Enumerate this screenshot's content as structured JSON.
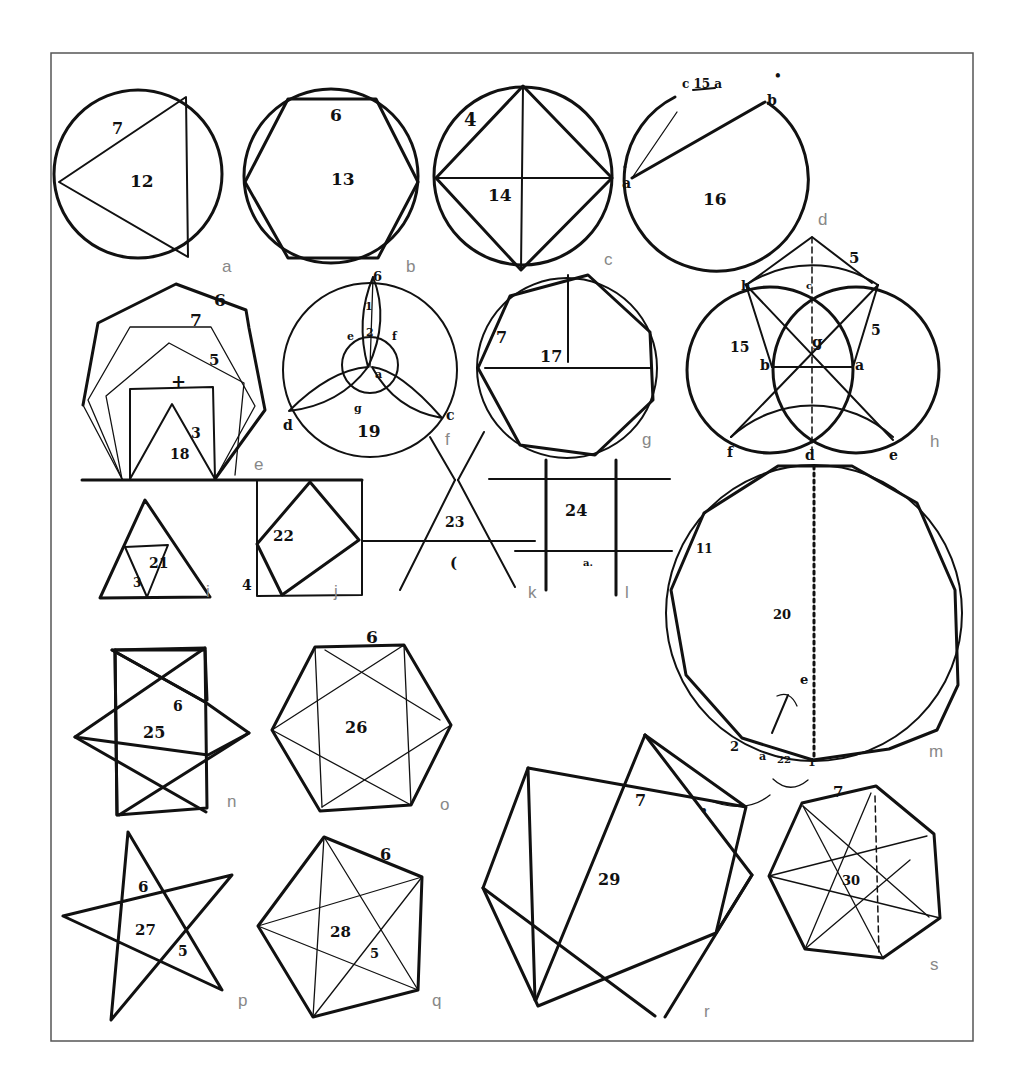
{
  "frame": {
    "x": 51,
    "y": 53,
    "width": 922,
    "height": 988,
    "border_color": "#555555"
  },
  "figures": [
    {
      "id": "a",
      "caption": "a",
      "description": "equilateral triangle inscribed in circle",
      "labels": {
        "number": "12",
        "side": "7"
      }
    },
    {
      "id": "b",
      "caption": "b",
      "description": "hexagon inscribed in circle",
      "labels": {
        "number": "13",
        "side": "6"
      }
    },
    {
      "id": "c",
      "caption": "c",
      "description": "square inscribed in circle with diameters",
      "labels": {
        "number": "14",
        "side": "4"
      }
    },
    {
      "id": "d",
      "caption": "d",
      "description": "circle with chords from point a",
      "labels": {
        "number": "16",
        "point_a": "a",
        "point_b": "b",
        "arc_label": "c 15 a",
        "dot": "•"
      }
    },
    {
      "id": "e",
      "caption": "e",
      "description": "nested polygons on a common base",
      "labels": {
        "number": "18",
        "heptagon": "7",
        "hexagon": "6",
        "pentagon": "5",
        "square": "+",
        "triangle": "3"
      }
    },
    {
      "id": "f",
      "caption": "f",
      "description": "trefoil construction in circle",
      "labels": {
        "number": "19",
        "side_1": "1",
        "side_2": "2",
        "point_b": "b",
        "point_e": "e",
        "point_f": "f",
        "point_a": "a",
        "point_g": "g",
        "point_d": "d",
        "point_c": "c"
      }
    },
    {
      "id": "g",
      "caption": "g",
      "description": "heptagon inscribed in circle",
      "labels": {
        "number": "17",
        "side": "7"
      }
    },
    {
      "id": "h",
      "caption": "h",
      "description": "pentagon construction with intersecting circles",
      "labels": {
        "number": "15",
        "side": "5",
        "point_h": "h",
        "point_c": "c",
        "point_g": "g",
        "point_b": "b",
        "point_a": "a",
        "point_5": "5",
        "point_f": "f",
        "point_d": "d",
        "point_e": "e"
      }
    },
    {
      "id": "i",
      "caption": "i",
      "description": "subdivided equilateral triangle",
      "labels": {
        "number": "21",
        "small": "3"
      }
    },
    {
      "id": "j",
      "caption": "j",
      "description": "square inscribed in square",
      "labels": {
        "number": "22",
        "corner": "4"
      }
    },
    {
      "id": "k",
      "caption": "k",
      "description": "crossing lines forming triangle",
      "labels": {
        "number": "23",
        "mark": "("
      }
    },
    {
      "id": "l",
      "caption": "l",
      "description": "grid of crossing lines",
      "labels": {
        "number": "24",
        "mark": "a."
      }
    },
    {
      "id": "m",
      "caption": "m",
      "description": "11-gon inscribed in circle with dotted diameter",
      "labels": {
        "number": "20",
        "side": "11",
        "point_e": "e",
        "point_2": "2",
        "point_a": "a",
        "arc": "22",
        "point_1": "1"
      }
    },
    {
      "id": "n",
      "caption": "n",
      "description": "six-pointed star",
      "labels": {
        "number": "25",
        "side": "6"
      }
    },
    {
      "id": "o",
      "caption": "o",
      "description": "hexagon with inscribed star",
      "labels": {
        "number": "26",
        "side": "6"
      }
    },
    {
      "id": "p",
      "caption": "p",
      "description": "five-pointed star",
      "labels": {
        "number": "27",
        "top": "6",
        "side": "5"
      }
    },
    {
      "id": "q",
      "caption": "q",
      "description": "pentagon with inscribed star",
      "labels": {
        "number": "28",
        "side": "6",
        "inner": "5"
      }
    },
    {
      "id": "r",
      "caption": "r",
      "description": "seven-pointed star",
      "labels": {
        "number": "29",
        "side": "7",
        "dot": "•"
      }
    },
    {
      "id": "s",
      "caption": "s",
      "description": "heptagon with inscribed star",
      "labels": {
        "number": "30",
        "side": "7"
      }
    }
  ]
}
